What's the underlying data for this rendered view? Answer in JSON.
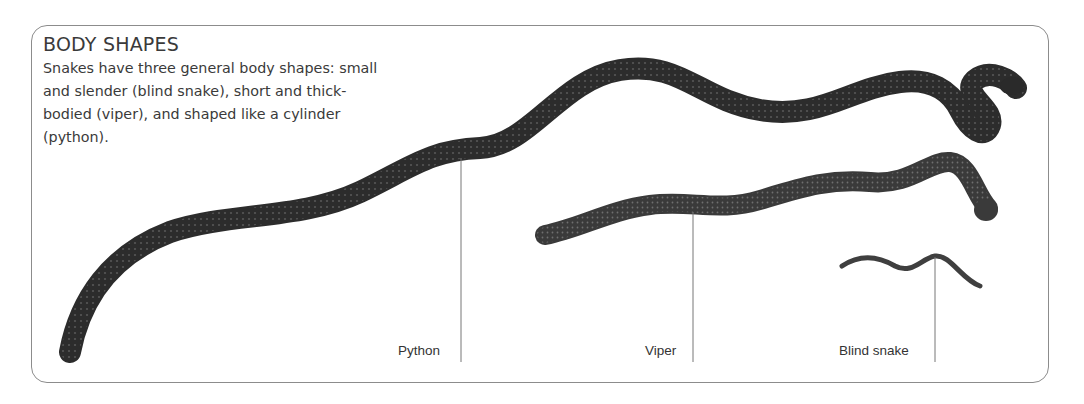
{
  "panel": {
    "title": "BODY SHAPES",
    "description": "Snakes have three general body shapes: small and slender (blind snake), short and thick-bodied (viper), and shaped like a cylinder (python)."
  },
  "labels": {
    "python": "Python",
    "viper": "Viper",
    "blind_snake": "Blind snake"
  },
  "colors": {
    "frame": "#8c8c8c",
    "text": "#3a3a3a",
    "python_body": "#2e2e2e",
    "viper_body": "#3d3d3d",
    "blind_body": "#444444",
    "leader_line": "#777777"
  }
}
